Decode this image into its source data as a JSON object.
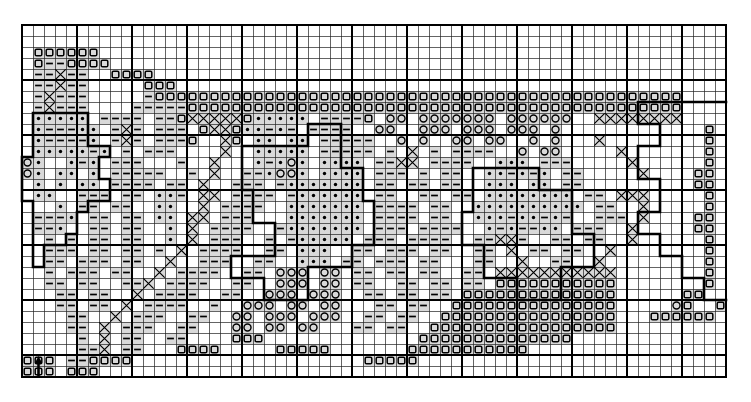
{
  "figure": {
    "kind": "gridded-symbol-map",
    "title": "",
    "grid": {
      "cols": 64,
      "rows": 32,
      "cell_px": 11,
      "origin_x_px": 22,
      "origin_y_px": 25,
      "minor_line_color": "#222222",
      "minor_line_width_px": 0.7,
      "major_line_color": "#000000",
      "major_line_width_px": 1.9,
      "major_every": 5,
      "frame_color": "#000000",
      "frame_width_px": 2.4
    },
    "shading": {
      "cell_fill": "#d9d9d9",
      "empty_fill": "#ffffff"
    },
    "symbols": [
      {
        "key": "d",
        "name": "filled-dot",
        "glyph": "•",
        "color": "#000000"
      },
      {
        "key": "-",
        "name": "dash",
        "glyph": "—",
        "color": "#000000"
      },
      {
        "key": "s",
        "name": "open-square",
        "glyph": "□",
        "color": "#000000"
      },
      {
        "key": "o",
        "name": "open-circle",
        "glyph": "○",
        "color": "#000000"
      },
      {
        "key": "x",
        "name": "cross",
        "glyph": "✕",
        "color": "#000000"
      }
    ],
    "arrow_marker": {
      "name": "up-arrow-marker",
      "col": 1,
      "row": 30,
      "color": "#000000"
    }
  },
  "chart_data": {
    "type": "heatmap",
    "title": "",
    "subtitle": "",
    "xlabel": "",
    "ylabel": "",
    "legend": [],
    "grid": true,
    "xlim": [
      0,
      64
    ],
    "ylim": [
      0,
      32
    ],
    "categories": [],
    "values": [],
    "symbol_legend": {
      "d": "filled-dot",
      "-": "dash",
      "s": "open-square",
      "o": "open-circle",
      "x": "cross"
    },
    "cells": [
      "................................................................",
      "................................................................",
      ".ssssss.........................................................",
      ".s--ssss........................................................",
      ".--x--..ssss....................................................",
      ".--x--.....sss..................................................",
      ".-x---.....-ssssssssssssssssssssssssssssssssssssssssssssssss....",
      ".-x---....-----sssssssssssssssssssssssssssssssssssssssssssss....",
      ".ddddd.----.--sxxxxxsddddd.----s.oo.ooooooo.oooooo..xxxxxxxx....",
      ".d---dd.-x-.---.sxxsdd-d-.----..oo..ooo.ooo.ooo.o.............s.",
      ".d----d.-x-.---s..xs.dd.dd.-----..o.o..oo.oo..o.o...x.........s.",
      ".ddddd-d.-.---....x..ddddd.-----.-.x.-.----..o.oo.....x.......s.",
      "od..d-d.---...-..x...d-dod.dddd.--xx.----..ddd.---.....x......s.",
      "od.dd.d.-----..-.x..--dood.dddd.---.-.--..dd-d-d.--.....x....ss.",
      ".d.d.dd.----.--.x..---.-ddddddd.--.--.--..ddd.dd.--..........ss.",
      ".dd..---.--.dd-.xx.----.-dddddd.--..--.--.dddddddd.--.xxx.....s.",
      "...d.--.--..dd..x.----..ddddddd.----.--..dddddddddd.--..x.....s.",
      ".---d.--.--.dd.xx.---...ddddddd.----.--..ddd-dd-d-..---.x....ss.",
      ".--d..--.--..d.x.----..-ddddddd.---.----..d-d--dd.---..x.....ss.",
      "..-.-.--.--..d.x.---..-.-ddddd.---.----..--xx-..--.--..x......s.",
      "..---.--.--.-.x.----..--.ddd..--.---.--..--.x.--.--..x........s.",
      "..--.---.--..x..---..--..ddd.--.---.--...--..x..--..x.........s.",
      "..-.---.--..x.----..--.ooo.oo.--.--.--..--.xxxxxxxxxxx........s.",
      "..--.--..--x.----..--..ooo.oo.--..--.--.--.sssssssssss........s.",
      "...--.--..x.----..--..ooo.ooo..--.--.--.ssssssssssssss......ss..",
      "...--.--.x.----..-..ooo.oo.oo...--.--..sssssssssssssss.....os..s",
      "....--..x.---..--..oo.ooo.ooo..--.--..ssssssssssssssss...ssssss.",
      "....--.x.---..--...oo.oo.oo...--.--..sssssssssssssssss..........",
      ".....-.x.--..--....sss..............ssssssssssssss..............",
      ".....--x.--...ssss.....sssss.......sssssssssss..................",
      "sss.--ssss.....................sssss............................",
      "sss.sss........................................................."
    ]
  },
  "outline_paths": [
    "M 1,8 L 6,8 L 6,11 L 8,11 L 8,12 L 7,12 L 7,14 L 8,14 L 8,16 L 6,16 L 6,17 L 5,17 L 5,19 L 4,19 L 4,20 L 2,20 L 2,22 L 1,22 L 1,16 L 0,16 L 0,12 L 1,12 Z",
    "M 20,11 L 26,11 L 26,9 L 29,9 L 29,13 L 31,13 L 31,16 L 32,16 L 32,20 L 30,20 L 30,22 L 26,22 L 26,25 L 22,25 L 22,23 L 19,23 L 19,21 L 23,21 L 23,18 L 21,18 L 21,15 L 20,15 Z",
    "M 41,13 L 47,13 L 47,15 L 50,15 L 50,19 L 52,19 L 52,22 L 49,22 L 49,25 L 45,25 L 45,23 L 42,23 L 42,20 L 40,20 L 40,17 L 41,17 Z",
    "M 64,7 L 56,7 L 56,9 L 58,9 L 58,11 L 56,11 L 56,14 L 58,14 L 58,17 L 56,17 L 56,19 L 58,19 L 58,21 L 60,21 L 60,23 L 62,23 L 62,25 L 64,25"
  ]
}
